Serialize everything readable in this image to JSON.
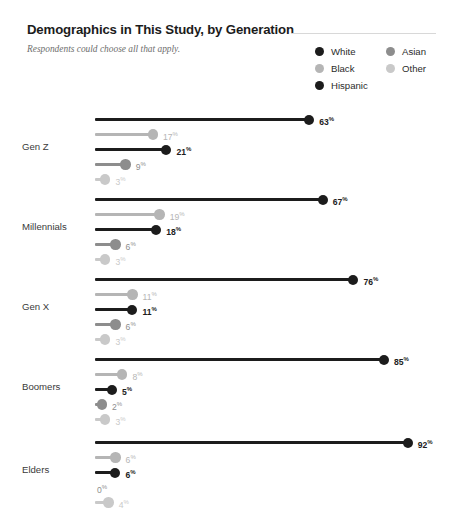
{
  "header": {
    "title": "Demographics in This Study, by Generation",
    "subtitle": "Respondents could choose all that apply."
  },
  "legend": {
    "columns": [
      [
        {
          "label": "White",
          "color": "#1c1c1c"
        },
        {
          "label": "Black",
          "color": "#b5b5b5"
        },
        {
          "label": "Hispanic",
          "color": "#1c1c1c"
        }
      ],
      [
        {
          "label": "Asian",
          "color": "#8d8d8d"
        },
        {
          "label": "Other",
          "color": "#c9c9c9"
        }
      ]
    ]
  },
  "chart_data": {
    "type": "bar",
    "title": "Demographics in This Study, by Generation",
    "subtitle": "Respondents could choose all that apply.",
    "xlabel": "",
    "ylabel": "",
    "xlim": [
      0,
      100
    ],
    "grid": false,
    "legend_position": "top-right",
    "unit": "%",
    "categories": [
      "Gen Z",
      "Millennials",
      "Gen X",
      "Boomers",
      "Elders"
    ],
    "series": [
      {
        "name": "White",
        "color": "#1c1c1c",
        "values": [
          63,
          67,
          76,
          85,
          92
        ]
      },
      {
        "name": "Black",
        "color": "#b5b5b5",
        "values": [
          17,
          19,
          11,
          8,
          6
        ]
      },
      {
        "name": "Hispanic",
        "color": "#1c1c1c",
        "values": [
          21,
          18,
          11,
          5,
          6
        ]
      },
      {
        "name": "Asian",
        "color": "#8d8d8d",
        "values": [
          9,
          6,
          6,
          2,
          0
        ]
      },
      {
        "name": "Other",
        "color": "#c9c9c9",
        "values": [
          3,
          3,
          3,
          3,
          4
        ]
      }
    ],
    "labels": {
      "Gen Z": [
        "63",
        "17",
        "21",
        "9",
        "3"
      ],
      "Millennials": [
        "67",
        "19",
        "18",
        "6",
        "3"
      ],
      "Gen X": [
        "76",
        "11",
        "11",
        "6",
        "3"
      ],
      "Boomers": [
        "85",
        "8",
        "5",
        "2",
        "3"
      ],
      "Elders": [
        "92",
        "6",
        "6",
        "0",
        "4"
      ]
    }
  }
}
